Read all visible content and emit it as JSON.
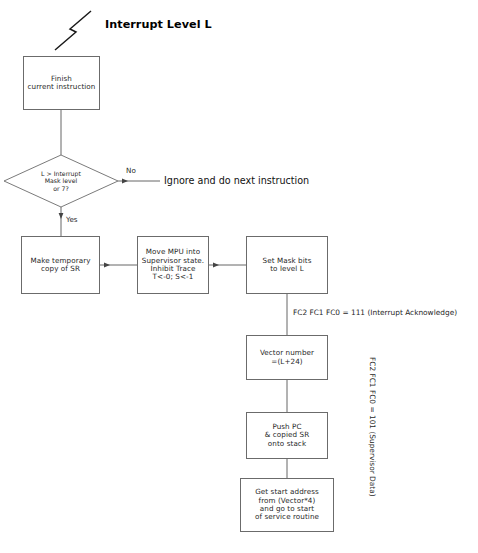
{
  "diagram": {
    "title": "Interrupt Level L",
    "bolt_icon": "lightning-bolt-icon",
    "nodes": {
      "finish": "Finish\ncurrent instruction",
      "decision": "L > Interrupt\nMask level\nor 7?",
      "copy_sr": "Make temporary\ncopy of SR",
      "supervisor": "Move MPU into\nSupervisor state.\nInhibit Trace\nT<-0; S<-1",
      "set_mask": "Set Mask bits\nto level L",
      "vector": "Vector number\n=(L+24)",
      "push": "Push PC\n& copied SR\nonto stack",
      "start_address": "Get start address\nfrom (Vector*4)\nand go to start\nof service routine"
    },
    "edge_labels": {
      "no": "No",
      "yes": "Yes"
    },
    "annotations": {
      "ignore": "Ignore and do next instruction",
      "fc_ack": "FC2 FC1 FC0 = 111 (Interrupt Acknowledge)",
      "fc_supervisor_data": "FC2 FC1 FC0 = 101 (Supervisor Data)"
    },
    "colors": {
      "stroke": "#6b6b6b",
      "line": "#555555",
      "text": "#1f1f1f",
      "background": "#ffffff"
    }
  }
}
